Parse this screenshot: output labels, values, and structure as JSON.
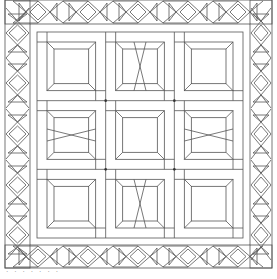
{
  "artwork": {
    "title": "Quilt pattern line drawing",
    "canvas": {
      "width": 277,
      "height": 279
    },
    "line_color": "#555555",
    "background": "#ffffff",
    "outer_frame": {
      "x": 5,
      "y": 0,
      "w": 267,
      "h": 268
    },
    "border_strip_width": 25,
    "inner_band": {
      "x": 30,
      "y": 24,
      "w": 220,
      "h": 221
    },
    "quilt_center": {
      "x": 37,
      "y": 32,
      "w": 206,
      "h": 206
    },
    "grid": {
      "rows": 3,
      "cols": 3
    },
    "block_style": "framed square (bevelled frame) with sashing rectangles",
    "border_motif": "diamonds alternating with triangle fans / hourglasses",
    "top_diamond_centers_x": [
      38,
      88,
      138,
      188,
      238
    ],
    "side_diamond_centers_y": [
      33,
      83,
      134,
      185,
      235
    ]
  },
  "caption": {
    "text": "· ·  · ·   ·  ·   ·"
  }
}
